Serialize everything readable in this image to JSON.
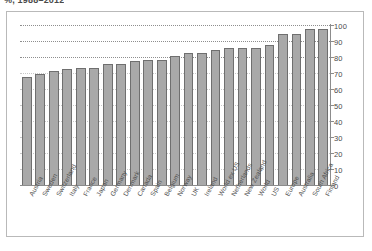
{
  "title": "%, 1988–2012",
  "chart_data": {
    "type": "bar",
    "title": "%, 1988–2012",
    "xlabel": "",
    "ylabel": "",
    "ylim": [
      0,
      100
    ],
    "yticks": [
      0,
      10,
      20,
      30,
      40,
      50,
      60,
      70,
      80,
      90,
      100
    ],
    "ytick_labels": [
      "0",
      "10",
      "20",
      "30",
      "40",
      "50",
      "60",
      "70",
      "80",
      "90",
      "100"
    ],
    "grid": "horizontal-dotted",
    "legend": "none",
    "bar_color": "#a9a9a9",
    "bar_edge_color": "#6f6f6f",
    "categories": [
      "Austria",
      "Sweden",
      "Switzerland",
      "Italy",
      "France",
      "Japan",
      "Germany",
      "Denmark",
      "Canada",
      "Spain",
      "Belgium",
      "Norway",
      "UK",
      "Ireland",
      "World ex US",
      "Netherlands",
      "New Zealand",
      "World",
      "US",
      "Europe",
      "Australia",
      "South Africa",
      "Finland"
    ],
    "values": [
      68,
      70,
      72,
      73,
      74,
      74,
      76,
      76,
      78,
      79,
      79,
      81,
      83,
      83,
      85,
      86,
      86,
      86,
      88,
      95,
      95,
      98,
      98
    ]
  }
}
